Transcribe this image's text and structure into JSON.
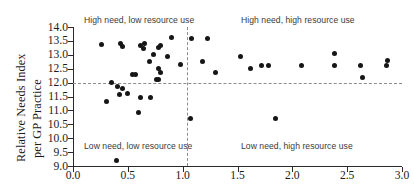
{
  "chart_data": {
    "type": "scatter",
    "title": "",
    "xlabel": "",
    "ylabel": "Relative Needs Index per GP Practice",
    "ylabel_lines": [
      "Relative Needs Index",
      "per GP Practice"
    ],
    "xlim": [
      0.0,
      3.0
    ],
    "ylim": [
      9.0,
      14.0
    ],
    "xticks": [
      "0.0",
      "0.5",
      "1.0",
      "1.5",
      "2.0",
      "2.5",
      "3.0"
    ],
    "xtick_values": [
      0.0,
      0.5,
      1.0,
      1.5,
      2.0,
      2.5,
      3.0
    ],
    "yticks": [
      "14.0",
      "13.5",
      "13.0",
      "12.5",
      "12.0",
      "11.5",
      "11.0",
      "10.5",
      "10.0",
      "9.5",
      "9.0"
    ],
    "ytick_values": [
      14.0,
      13.5,
      13.0,
      12.5,
      12.0,
      11.5,
      11.0,
      10.5,
      10.0,
      9.5,
      9.0
    ],
    "grid": false,
    "legend": null,
    "reference_lines": {
      "horizontal_y": 12.0,
      "vertical_x": 1.04,
      "style": "dashed",
      "color": "#8d8d8d"
    },
    "marker": {
      "shape": "circle",
      "color": "#161616",
      "size_px": 5
    },
    "annotations": [
      {
        "text": "High need, low resource use",
        "quadrant": "top-left",
        "x": 0.1,
        "y": 14.0
      },
      {
        "text": "High need, high resource use",
        "quadrant": "top-right",
        "x": 1.53,
        "y": 14.0
      },
      {
        "text": "Low need, low resource use",
        "quadrant": "bottom-left",
        "x": 0.1,
        "y": 9.55
      },
      {
        "text": "Low need, high resource use",
        "quadrant": "bottom-right",
        "x": 1.53,
        "y": 9.55
      }
    ],
    "points": [
      {
        "x": 0.26,
        "y": 13.37
      },
      {
        "x": 0.43,
        "y": 13.4
      },
      {
        "x": 0.45,
        "y": 13.3
      },
      {
        "x": 0.62,
        "y": 13.33
      },
      {
        "x": 0.64,
        "y": 13.22
      },
      {
        "x": 0.65,
        "y": 13.4
      },
      {
        "x": 0.78,
        "y": 13.27
      },
      {
        "x": 0.8,
        "y": 13.33
      },
      {
        "x": 0.9,
        "y": 13.61
      },
      {
        "x": 1.08,
        "y": 13.6
      },
      {
        "x": 0.73,
        "y": 13.0
      },
      {
        "x": 0.7,
        "y": 12.76
      },
      {
        "x": 0.86,
        "y": 12.94
      },
      {
        "x": 0.98,
        "y": 12.64
      },
      {
        "x": 0.78,
        "y": 12.49
      },
      {
        "x": 0.8,
        "y": 12.37
      },
      {
        "x": 0.54,
        "y": 12.3
      },
      {
        "x": 0.57,
        "y": 12.3
      },
      {
        "x": 0.76,
        "y": 12.12
      },
      {
        "x": 0.78,
        "y": 12.1
      },
      {
        "x": 0.35,
        "y": 12.0
      },
      {
        "x": 0.41,
        "y": 11.85
      },
      {
        "x": 0.45,
        "y": 11.8
      },
      {
        "x": 0.5,
        "y": 11.62
      },
      {
        "x": 0.31,
        "y": 11.33
      },
      {
        "x": 0.42,
        "y": 11.58
      },
      {
        "x": 0.62,
        "y": 11.48
      },
      {
        "x": 0.71,
        "y": 11.47
      },
      {
        "x": 0.6,
        "y": 10.93
      },
      {
        "x": 0.4,
        "y": 9.18
      },
      {
        "x": 1.07,
        "y": 10.72
      },
      {
        "x": 1.23,
        "y": 13.6
      },
      {
        "x": 1.18,
        "y": 12.77
      },
      {
        "x": 1.3,
        "y": 12.38
      },
      {
        "x": 1.53,
        "y": 12.93
      },
      {
        "x": 1.62,
        "y": 12.5
      },
      {
        "x": 1.72,
        "y": 12.62
      },
      {
        "x": 1.78,
        "y": 12.62
      },
      {
        "x": 1.85,
        "y": 10.7
      },
      {
        "x": 2.08,
        "y": 12.63
      },
      {
        "x": 2.38,
        "y": 12.63
      },
      {
        "x": 2.38,
        "y": 13.04
      },
      {
        "x": 2.62,
        "y": 12.62
      },
      {
        "x": 2.64,
        "y": 12.2
      },
      {
        "x": 2.87,
        "y": 12.78
      },
      {
        "x": 2.86,
        "y": 12.6
      }
    ]
  }
}
